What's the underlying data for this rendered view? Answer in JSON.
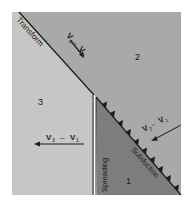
{
  "diagram": {
    "plates": [
      {
        "id": "1",
        "label": "1"
      },
      {
        "id": "2",
        "label": "2"
      },
      {
        "id": "3",
        "label": "3"
      }
    ],
    "boundaries": {
      "transform": "Transform",
      "spreading": "Spreading",
      "subduction": "Subduction"
    },
    "vectors": {
      "v2_minus_v3": {
        "a": "V",
        "a_sub": "2",
        "op": "–",
        "b": "V",
        "b_sub": "3"
      },
      "v3_minus_v1": {
        "a": "V",
        "a_sub": "3",
        "op": "–",
        "b": "V",
        "b_sub": "1"
      },
      "v2_minus_v1": {
        "a": "V",
        "a_sub": "2",
        "op": "–",
        "b": "V",
        "b_sub": "1"
      }
    },
    "colors": {
      "plate_2": "#a9a9a9",
      "plate_3": "#c6c6c6",
      "plate_1": "#7d7d7d",
      "lines": "#1c1c1c"
    }
  }
}
